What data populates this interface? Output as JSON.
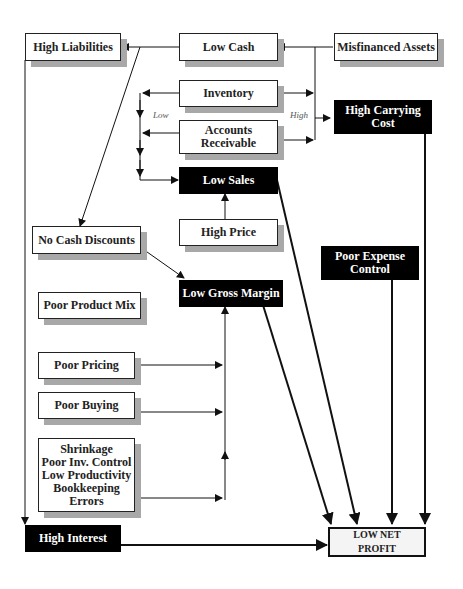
{
  "diagram": {
    "nodes": {
      "high_liabilities": "High Liabilities",
      "low_cash": "Low Cash",
      "misfinanced_assets": "Misfinanced Assets",
      "inventory": "Inventory",
      "accounts_receivable": "Accounts\nReceivable",
      "high_carrying_cost": "High Carrying\nCost",
      "low_sales": "Low Sales",
      "high_price": "High Price",
      "no_cash_discounts": "No Cash Discounts",
      "low_gross_margin": "Low Gross Margin",
      "poor_product_mix": "Poor Product Mix",
      "poor_expense_control": "Poor Expense\nControl",
      "poor_pricing": "Poor Pricing",
      "poor_buying": "Poor Buying",
      "shrinkage_group": "Shrinkage\nPoor Inv. Control\nLow Productivity\nBookkeeping\nErrors",
      "high_interest": "High Interest",
      "low_net_profit": "LOW NET\nPROFIT"
    },
    "labels": {
      "low": "Low",
      "high": "High"
    },
    "colors": {
      "line": "#111111",
      "shadow": "#a8a8a8",
      "dark_box": "#000000"
    }
  }
}
